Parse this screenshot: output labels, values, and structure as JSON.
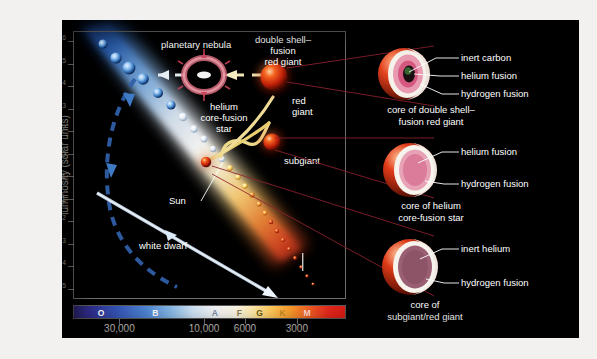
{
  "figure": {
    "background_color": "#000000",
    "page_color": "#f2f1ef"
  },
  "chart_data": {
    "type": "scatter",
    "xlabel": "surface temperature (Kelvin)",
    "ylabel": "luminosity (solar units)",
    "x_axis_reversed": true,
    "x_scale": "log",
    "y_scale": "log",
    "xlim": [
      45000,
      2200
    ],
    "ylim": [
      1e-05,
      1000000.0
    ],
    "grid": false,
    "legend": "none",
    "y_ticks": [
      "10⁶",
      "10⁵",
      "10⁴",
      "10³",
      "10²",
      "10",
      "1",
      "0.1",
      "10⁻²",
      "10⁻³",
      "10⁻⁴",
      "10⁻⁵"
    ],
    "y_tick_values": [
      1000000,
      100000,
      10000,
      1000,
      100,
      10,
      1,
      0.1,
      0.01,
      0.001,
      0.0001,
      1e-05
    ],
    "x_ticks": [
      "30,000",
      "10,000",
      "6000",
      "3000"
    ],
    "x_tick_values": [
      30000,
      10000,
      6000,
      3000
    ],
    "spectral_classes": [
      {
        "label": "O",
        "color": "#ffffff",
        "position_pct": 10
      },
      {
        "label": "B",
        "color": "#ffffff",
        "position_pct": 30
      },
      {
        "label": "A",
        "color": "#7b8fa8",
        "position_pct": 52
      },
      {
        "label": "F",
        "color": "#8a7f50",
        "position_pct": 61
      },
      {
        "label": "G",
        "color": "#6d5a16",
        "position_pct": 68.5
      },
      {
        "label": "K",
        "color": "#c8881f",
        "position_pct": 77
      },
      {
        "label": "M",
        "color": "#ffd9d2",
        "position_pct": 86
      }
    ],
    "annotations": [
      {
        "name": "planetary-nebula",
        "text": "planetary nebula"
      },
      {
        "name": "double-shell-fusion-red-giant",
        "text": "double shell–\nfusion\nred giant"
      },
      {
        "name": "red-giant",
        "text": "red\ngiant"
      },
      {
        "name": "helium-core-fusion-star",
        "text": "helium\ncore-fusion\nstar"
      },
      {
        "name": "subgiant",
        "text": "subgiant"
      },
      {
        "name": "sun",
        "text": "Sun"
      },
      {
        "name": "white-dwarf",
        "text": "white dwarf"
      }
    ],
    "series": [
      {
        "name": "main sequence",
        "description": "diagonal band of stars from hot luminous blue upper-left to cool dim red lower-right"
      },
      {
        "name": "evolutionary track",
        "description": "yellow track from main-sequence turnoff through subgiant, red giant, helium core-fusion, double shell-fusion red giant, planetary nebula, to white dwarf"
      }
    ]
  },
  "plot_labels": {
    "planetary_nebula": "planetary nebula",
    "double_shell_l1": "double shell–",
    "double_shell_l2": "fusion",
    "double_shell_l3": "red giant",
    "red_giant_l1": "red",
    "red_giant_l2": "giant",
    "helium_core_l1": "helium",
    "helium_core_l2": "core-fusion",
    "helium_core_l3": "star",
    "subgiant": "subgiant",
    "sun": "Sun",
    "white_dwarf": "white dwarf"
  },
  "axes": {
    "y_title": "luminosity (solar units)",
    "x_title": "surface temperature (Kelvin)",
    "y_labels": [
      {
        "base": "10",
        "exp": "6"
      },
      {
        "base": "10",
        "exp": "5"
      },
      {
        "base": "10",
        "exp": "4"
      },
      {
        "base": "10",
        "exp": "3"
      },
      {
        "base": "10",
        "exp": "2"
      },
      {
        "base": "10",
        "exp": ""
      },
      {
        "base": "1",
        "exp": ""
      },
      {
        "base": "0.1",
        "exp": ""
      },
      {
        "base": "10",
        "exp": "-2"
      },
      {
        "base": "10",
        "exp": "-3"
      },
      {
        "base": "10",
        "exp": "-4"
      },
      {
        "base": "10",
        "exp": "-5"
      }
    ],
    "x_labels": [
      "30,000",
      "10,000",
      "6000",
      "3000"
    ]
  },
  "panels": [
    {
      "id": "double-shell",
      "caption_l1": "core of double shell–",
      "caption_l2": "fusion red giant",
      "annotations": [
        "inert carbon",
        "helium fusion",
        "hydrogen fusion"
      ]
    },
    {
      "id": "helium-core",
      "caption_l1": "core of helium",
      "caption_l2": "core-fusion star",
      "annotations": [
        "helium fusion",
        "hydrogen fusion"
      ]
    },
    {
      "id": "subgiant-red-giant",
      "caption_l1": "core of",
      "caption_l2": "subgiant/red giant",
      "annotations": [
        "inert helium",
        "hydrogen fusion"
      ]
    }
  ]
}
